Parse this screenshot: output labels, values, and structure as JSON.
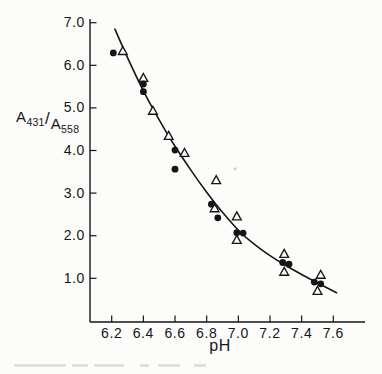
{
  "figure": {
    "background": "#fcfcfa",
    "ink": "#161616"
  },
  "chart_data": {
    "type": "scatter",
    "title": "",
    "xlabel": "pH",
    "ylabel": "A431/A558",
    "ylabel_parts": {
      "numerator_base": "A",
      "numerator_sub": "431",
      "slash": "/",
      "denominator_base": "A",
      "denominator_sub": "558"
    },
    "xlim": [
      6.06,
      7.8
    ],
    "ylim": [
      0.0,
      7.1
    ],
    "grid": false,
    "legend": "none",
    "x_ticks": [
      {
        "value": 6.2,
        "label": "6.2"
      },
      {
        "value": 6.4,
        "label": "6.4"
      },
      {
        "value": 6.6,
        "label": "6.6"
      },
      {
        "value": 6.8,
        "label": "6.8"
      },
      {
        "value": 7.0,
        "label": "7.0"
      },
      {
        "value": 7.2,
        "label": "7.2"
      },
      {
        "value": 7.4,
        "label": "7.4"
      },
      {
        "value": 7.6,
        "label": "7.6"
      }
    ],
    "y_ticks": [
      {
        "value": 7.0,
        "label": "7.0"
      },
      {
        "value": 6.0,
        "label": "6.0"
      },
      {
        "value": 5.0,
        "label": "5.0"
      },
      {
        "value": 4.0,
        "label": "4.0"
      },
      {
        "value": 3.0,
        "label": "3.0"
      },
      {
        "value": 2.0,
        "label": "2.0"
      },
      {
        "value": 1.0,
        "label": "1.0"
      }
    ],
    "series": [
      {
        "name": "filled circles",
        "marker": "filled-circle",
        "color": "#161616",
        "points": [
          [
            6.21,
            6.29
          ],
          [
            6.4,
            5.56
          ],
          [
            6.4,
            5.38
          ],
          [
            6.6,
            4.01
          ],
          [
            6.6,
            3.56
          ],
          [
            6.83,
            2.74
          ],
          [
            6.87,
            2.42
          ],
          [
            6.99,
            2.07
          ],
          [
            7.03,
            2.06
          ],
          [
            7.28,
            1.37
          ],
          [
            7.32,
            1.33
          ],
          [
            7.48,
            0.91
          ],
          [
            7.52,
            0.87
          ]
        ]
      },
      {
        "name": "open triangles",
        "marker": "open-triangle",
        "color": "#161616",
        "points": [
          [
            6.27,
            6.33
          ],
          [
            6.4,
            5.7
          ],
          [
            6.46,
            4.93
          ],
          [
            6.56,
            4.34
          ],
          [
            6.66,
            3.94
          ],
          [
            6.86,
            3.3
          ],
          [
            6.85,
            2.64
          ],
          [
            6.99,
            2.45
          ],
          [
            6.99,
            1.9
          ],
          [
            7.29,
            1.57
          ],
          [
            7.29,
            1.15
          ],
          [
            7.52,
            1.08
          ],
          [
            7.5,
            0.7
          ]
        ]
      }
    ],
    "fit_curve": [
      [
        6.22,
        6.85
      ],
      [
        6.3,
        6.18
      ],
      [
        6.4,
        5.4
      ],
      [
        6.5,
        4.72
      ],
      [
        6.6,
        4.1
      ],
      [
        6.7,
        3.54
      ],
      [
        6.8,
        3.02
      ],
      [
        6.9,
        2.55
      ],
      [
        7.0,
        2.13
      ],
      [
        7.1,
        1.8
      ],
      [
        7.2,
        1.53
      ],
      [
        7.3,
        1.3
      ],
      [
        7.4,
        1.09
      ],
      [
        7.5,
        0.89
      ],
      [
        7.62,
        0.66
      ]
    ]
  }
}
